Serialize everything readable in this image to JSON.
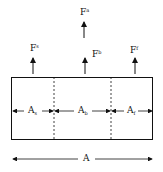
{
  "forces": {
    "total": {
      "base": "F",
      "sup": "a"
    },
    "left": {
      "base": "F",
      "sup": "s"
    },
    "middle": {
      "base": "F",
      "sup": "b"
    },
    "right": {
      "base": "F",
      "sup": "f"
    }
  },
  "areas": {
    "left": {
      "base": "A",
      "sub": "s"
    },
    "middle": {
      "base": "A",
      "sub": "b"
    },
    "right": {
      "base": "A",
      "sub": "f"
    },
    "total": {
      "base": "A"
    }
  },
  "colors": {
    "line": "#111111",
    "background": "#ffffff"
  }
}
